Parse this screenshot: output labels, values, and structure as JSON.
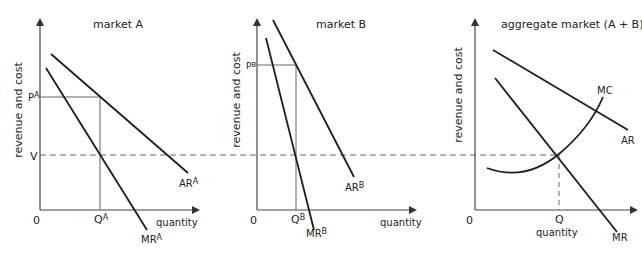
{
  "colors": {
    "curve": "#1e1e1e",
    "axis": "#555555",
    "guide": "#666666",
    "text": "#222222"
  },
  "panels": [
    {
      "title": "market A",
      "y_axis_label": "revenue and cost",
      "x_axis_label": "quantity",
      "origin": "0",
      "price_label": "P",
      "price_sup": "A",
      "v_label": "V",
      "q_label": "Q",
      "q_sup": "A",
      "ar_label": "AR",
      "ar_sup": "A",
      "mr_label": "MR",
      "mr_sup": "A"
    },
    {
      "title": "market B",
      "y_axis_label": "revenue and cost",
      "x_axis_label": "quantity",
      "origin": "0",
      "price_label": "P",
      "price_sup": "B",
      "q_label": "Q",
      "q_sup": "B",
      "ar_label": "AR",
      "ar_sup": "B",
      "mr_label": "MR",
      "mr_sup": "B"
    },
    {
      "title": "aggregate market (A + B)",
      "y_axis_label": "revenue and cost",
      "x_axis_label": "quantity",
      "origin": "0",
      "q_label": "Q",
      "ar_label": "AR",
      "mr_label": "MR",
      "mc_label": "MC"
    }
  ]
}
